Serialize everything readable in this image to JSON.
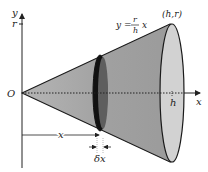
{
  "diagram": {
    "labels": {
      "y_axis": "y",
      "x_axis": "x",
      "origin": "O",
      "r_tick": "r",
      "h_tick": "h",
      "vertex": "(h,r)",
      "line_eq_lhs": "y =",
      "line_eq_num": "r",
      "line_eq_den": "h",
      "line_eq_var": "x",
      "slice_distance": "x",
      "slice_width": "δx"
    },
    "colors": {
      "cone_fill": "#a9a9a9",
      "cone_fill_dark": "#8c8c8c",
      "end_face_fill": "#cfcfcf",
      "slice_fill": "#5a5a5a",
      "outline": "#1a1a1a",
      "background": "#ffffff"
    }
  }
}
